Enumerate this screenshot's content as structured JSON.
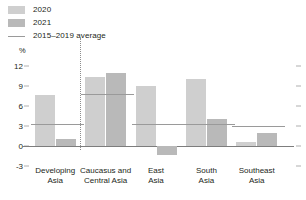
{
  "legend": {
    "items": [
      {
        "label": "2020",
        "type": "swatch",
        "color": "#cfcfcf",
        "name": "legend-2020"
      },
      {
        "label": "2021",
        "type": "swatch",
        "color": "#b9b9b9",
        "name": "legend-2021"
      },
      {
        "label": "2015–2019 average",
        "type": "line",
        "color": "#9a9a9a",
        "name": "legend-average"
      }
    ]
  },
  "chart_data": {
    "type": "bar",
    "title": "",
    "xlabel": "",
    "ylabel": "%",
    "unit": "%",
    "ylim": [
      -3,
      13.5
    ],
    "yticks": [
      -3,
      0,
      3,
      6,
      9,
      12
    ],
    "ytick_labels": [
      "-3",
      "0",
      "3",
      "6",
      "9",
      "12"
    ],
    "grid": false,
    "legend_position": "top-left",
    "categories": [
      "Developing\nAsia",
      "Caucasus and\nCentral Asia",
      "East\nAsia",
      "South\nAsia",
      "Southeast\nAsia"
    ],
    "category_labels": [
      {
        "line1": "Developing",
        "line2": "Asia"
      },
      {
        "line1": "Caucasus and",
        "line2": "Central Asia"
      },
      {
        "line1": "East",
        "line2": "Asia"
      },
      {
        "line1": "South",
        "line2": "Asia"
      },
      {
        "line1": "Southeast",
        "line2": "Asia"
      }
    ],
    "series": [
      {
        "name": "2020",
        "color": "#cfcfcf",
        "values": [
          7.6,
          10.3,
          9.0,
          10.0,
          0.6
        ]
      },
      {
        "name": "2021",
        "color": "#b9b9b9",
        "values": [
          1.0,
          11.0,
          -1.3,
          4.0,
          2.0
        ]
      }
    ],
    "reference_line": {
      "name": "2015–2019 average",
      "color": "#9a9a9a",
      "values": [
        3.3,
        7.8,
        3.3,
        3.3,
        3.0
      ]
    },
    "divider_after_category": 0
  }
}
